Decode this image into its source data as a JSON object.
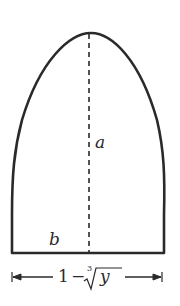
{
  "diagram": {
    "shape": "parabolic-arch cross-section",
    "labels": {
      "height": "a",
      "base": "b"
    },
    "dimension": {
      "one": "1",
      "minus": "−",
      "root_index": "3",
      "radicand": "y",
      "full_text": "1 − ∛y"
    },
    "colors": {
      "stroke": "#2a2a2a",
      "background": "#ffffff"
    }
  }
}
